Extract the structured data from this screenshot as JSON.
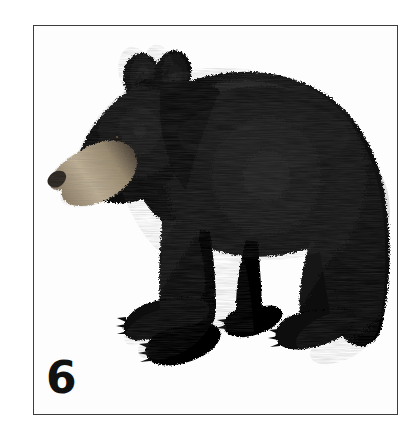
{
  "page": {
    "background_color": "#ffffff",
    "width": 415,
    "height": 437
  },
  "frame": {
    "border_color": "#3c3c3c",
    "border_width_px": 1,
    "background_color": "#fdfdfd"
  },
  "plate": {
    "number": "6"
  },
  "illustration": {
    "subject": "american-black-bear",
    "view": "side-profile-facing-left",
    "colors": {
      "fur_dark": "#0a0a0a",
      "fur_mid": "#1b1b1b",
      "fur_highlight": "#3a3a3a",
      "muzzle_tan": "#a89478",
      "muzzle_light": "#c3b49a",
      "nose_dark": "#2a2520",
      "eye": "#120f0c",
      "claw": "#0d0d0d",
      "background": "#ffffff"
    },
    "parts": [
      "left-ear",
      "right-ear",
      "head",
      "muzzle",
      "nose",
      "eye",
      "shoulder-hump",
      "back",
      "rump",
      "front-near-leg",
      "front-far-leg",
      "hind-near-leg",
      "hind-far-leg",
      "front-paw-claws",
      "hind-paw-claws"
    ]
  }
}
